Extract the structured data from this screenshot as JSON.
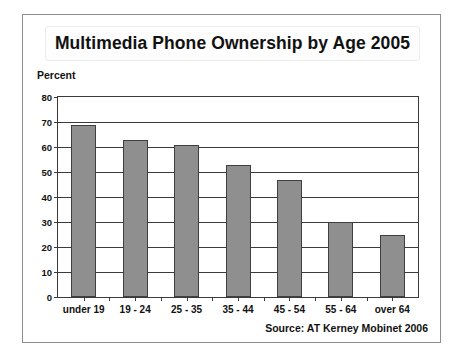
{
  "chart_data": {
    "type": "bar",
    "title": "Multimedia Phone Ownership by Age 2005",
    "xlabel": "",
    "ylabel": "Percent",
    "categories": [
      "under 19",
      "19 - 24",
      "25 - 35",
      "35 - 44",
      "45 - 54",
      "55 - 64",
      "over 64"
    ],
    "values": [
      69,
      63,
      61,
      53,
      47,
      30,
      25
    ],
    "ylim": [
      0,
      80
    ],
    "yticks": [
      0,
      10,
      20,
      30,
      40,
      50,
      60,
      70,
      80
    ],
    "ytick_labels": [
      "0",
      "10",
      "20",
      "30",
      "40",
      "50",
      "60",
      "70",
      "80"
    ],
    "grid": true,
    "legend": false,
    "annotations": [
      "Source: AT Kerney Mobinet 2006"
    ],
    "bar_color": "#8f8f8f",
    "bar_edge_color": "#3f3f3f",
    "axis_color": "#3a3a3a"
  },
  "figure": {
    "title": "Multimedia Phone Ownership by Age 2005",
    "y_axis_title": "Percent",
    "source": "Source: AT Kerney Mobinet 2006"
  }
}
